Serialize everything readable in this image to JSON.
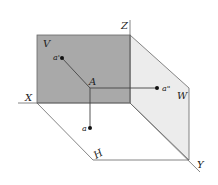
{
  "diagram": {
    "planes": {
      "V": {
        "label": "V",
        "fill": "#a9a9a9"
      },
      "W": {
        "label": "W",
        "fill": "#ececec"
      },
      "H": {
        "label": "H",
        "fill": "#ffffff"
      }
    },
    "axes": {
      "X": "X",
      "Y": "Y",
      "Z": "Z"
    },
    "points": {
      "A": "A",
      "a_prime": "a'",
      "a_double_prime": "a\"",
      "a": "a"
    },
    "colors": {
      "line": "#555555",
      "point": "#111111"
    }
  }
}
